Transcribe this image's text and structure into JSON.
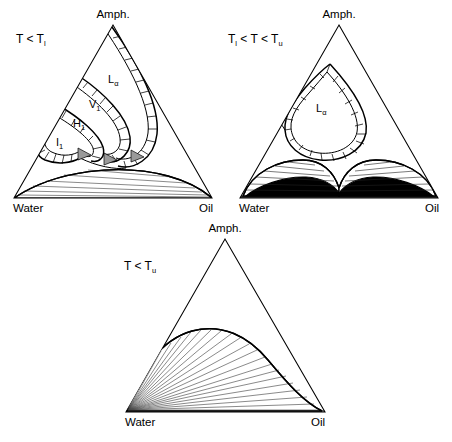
{
  "figure": {
    "background_color": "#ffffff",
    "line_color": "#000000",
    "fill_black": "#000000",
    "fill_gray": "#9a9a9a"
  },
  "common": {
    "vertex_top": "Amph.",
    "vertex_left": "Water",
    "vertex_right": "Oil"
  },
  "panels": [
    {
      "id": "panel-low-temperature",
      "condition": "T < T",
      "condition_sub": "l",
      "condition_full": "T < T_l",
      "vertex_top": "Amph.",
      "vertex_left": "Water",
      "vertex_right": "Oil",
      "phase_labels": [
        {
          "name": "L",
          "sub": "α",
          "full": "Lα",
          "x": 108,
          "y": 83
        },
        {
          "name": "V",
          "sub": "1",
          "full": "V1",
          "x": 89,
          "y": 108
        },
        {
          "name": "H",
          "sub": "1",
          "full": "H1",
          "x": 73,
          "y": 127
        },
        {
          "name": "I",
          "sub": "1",
          "full": "I1",
          "x": 56,
          "y": 146
        }
      ],
      "description": "Lamellar, cubic, hexagonal and micellar-cubic channels emanating from the amphiphile corner; two-phase dome with tie lines along the water-oil base."
    },
    {
      "id": "panel-intermediate-temperature",
      "condition": "T",
      "condition_sub": "l",
      "condition_full": "T_l < T < T_u",
      "condition_parts": [
        "T",
        "l",
        " < T < T",
        "u"
      ],
      "vertex_top": "Amph.",
      "vertex_left": "Water",
      "vertex_right": "Oil",
      "phase_labels": [
        {
          "name": "L",
          "sub": "α",
          "full": "Lα",
          "x": 316,
          "y": 112
        }
      ],
      "description": "Single lamellar teardrop loop; two black three-phase domes meeting at a central point above the water-oil base."
    },
    {
      "id": "panel-upper-temperature",
      "condition": "T < T",
      "condition_sub": "u",
      "condition_full": "T < T_u",
      "vertex_top": "Amph.",
      "vertex_left": "Water",
      "vertex_right": "Oil",
      "phase_labels": [],
      "description": "Single large two-phase dome with a fan of tie lines converging at the water corner."
    }
  ]
}
